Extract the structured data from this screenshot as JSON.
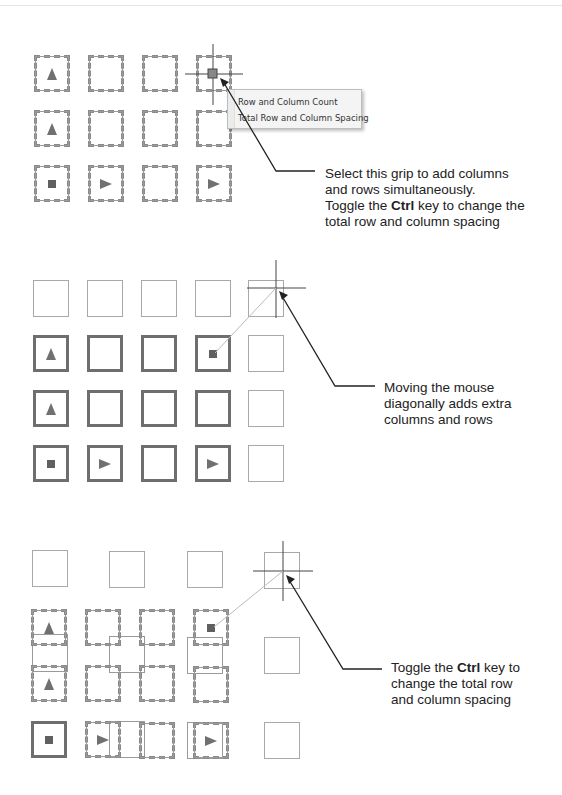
{
  "figure": {
    "panel1": {
      "context_menu": {
        "items": [
          {
            "label": "Row and Column Count"
          },
          {
            "label": "Total Row and Column Spacing"
          }
        ]
      },
      "callout": {
        "line1": "Select this grip to add columns",
        "line2": "and rows simultaneously.",
        "line3_pre": "Toggle the ",
        "line3_key": "Ctrl",
        "line3_post": " key to change the",
        "line4": "total row and column spacing"
      },
      "grid": {
        "rows": 3,
        "cols": 4,
        "glyphs": [
          [
            "triangle-up",
            "",
            "",
            "grip"
          ],
          [
            "triangle-up",
            "",
            "",
            ""
          ],
          [
            "square",
            "triangle-right",
            "",
            "triangle-right"
          ]
        ]
      }
    },
    "panel2": {
      "callout": {
        "line1": "Moving the mouse",
        "line2": "diagonally adds extra",
        "line3": "columns and rows"
      },
      "grid": {
        "rows": 4,
        "cols": 5,
        "glyphs": [
          [
            "",
            "",
            "",
            "",
            ""
          ],
          [
            "triangle-up",
            "",
            "",
            "square",
            ""
          ],
          [
            "triangle-up",
            "",
            "",
            "",
            ""
          ],
          [
            "square",
            "triangle-right",
            "",
            "triangle-right",
            ""
          ]
        ]
      }
    },
    "panel3": {
      "callout": {
        "line1_pre": "Toggle the ",
        "line1_key": "Ctrl",
        "line1_post": " key to",
        "line2": "change the total row",
        "line3": "and column spacing"
      },
      "grid": {
        "rows": 4,
        "cols": 5,
        "glyphs": [
          [
            "",
            "",
            "",
            "",
            ""
          ],
          [
            "triangle-up",
            "",
            "",
            "square",
            ""
          ],
          [
            "triangle-up",
            "",
            "",
            "",
            ""
          ],
          [
            "square",
            "triangle-right",
            "",
            "triangle-right",
            ""
          ]
        ]
      }
    },
    "colors": {
      "line": "#222222",
      "box_dark": "#6e6e6e",
      "box_light": "#a8a8a8",
      "glyph": "#707070",
      "menu_bg": "#f4f4f4"
    }
  }
}
